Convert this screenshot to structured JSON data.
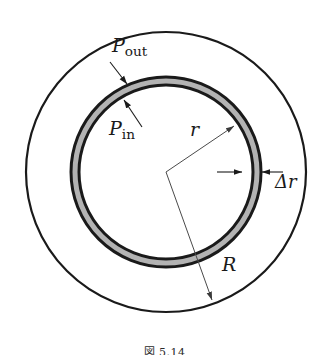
{
  "figure": {
    "kind": "annulus-pressure-diagram",
    "background_color": "#ffffff",
    "stroke_color": "#1a1a1a",
    "shade_color": "#b3b3b3",
    "thin_line_color": "#4a4a4a",
    "caption": "図 5.14"
  },
  "geometry": {
    "center_x": 166,
    "center_y": 172,
    "outer_circle_radius": 140,
    "annulus_outer_radius": 95,
    "annulus_inner_radius": 87,
    "outer_circle_stroke_width": 2.2,
    "annulus_stroke_width": 3.0
  },
  "labels": {
    "p_out": {
      "base": "P",
      "subscript": "out",
      "x": 112,
      "y": 52
    },
    "p_in": {
      "base": "P",
      "subscript": "in",
      "x": 109,
      "y": 135
    },
    "radius_r": {
      "base": "r",
      "subscript": "",
      "x": 190,
      "y": 136
    },
    "radius_R": {
      "base": "R",
      "subscript": "",
      "x": 222,
      "y": 271
    },
    "delta_r": {
      "base": "Δr",
      "subscript": "",
      "x": 275,
      "y": 188
    }
  },
  "leaders": {
    "p_out_arrow": {
      "from_x": 110,
      "from_y": 62,
      "to_x": 127,
      "to_y": 84,
      "points_to": "outer-edge-of-annulus"
    },
    "p_in_arrow": {
      "from_x": 142,
      "from_y": 127,
      "to_x": 124,
      "to_y": 100,
      "points_to": "inner-edge-of-annulus"
    },
    "r_line": {
      "from_x": 166,
      "from_y": 172,
      "to_x": 234,
      "to_y": 126,
      "points_to": "annulus-band"
    },
    "R_line": {
      "from_x": 166,
      "from_y": 172,
      "to_x": 212,
      "to_y": 300,
      "points_to": "outer-circle"
    },
    "delta_left_arrow": {
      "from_x": 217,
      "from_y": 172,
      "to_x": 242,
      "to_y": 172,
      "points_to": "annulus-left-edge"
    },
    "delta_right_arrow": {
      "from_x": 283,
      "from_y": 172,
      "to_x": 262,
      "to_y": 172,
      "points_to": "annulus-right-edge"
    }
  }
}
